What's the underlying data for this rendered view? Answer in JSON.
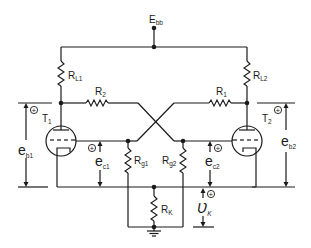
{
  "figure": {
    "type": "circuit-schematic"
  },
  "labels": {
    "supply": {
      "main": "E",
      "sub": "bb"
    },
    "rl1": {
      "main": "R",
      "sub": "L1"
    },
    "rl2": {
      "main": "R",
      "sub": "L2"
    },
    "r1": {
      "main": "R",
      "sub": "1"
    },
    "r2": {
      "main": "R",
      "sub": "2"
    },
    "rg1": {
      "main": "R",
      "sub": "g1"
    },
    "rg2": {
      "main": "R",
      "sub": "g2"
    },
    "rk": {
      "main": "R",
      "sub": "K"
    },
    "t1": {
      "main": "T",
      "sub": "1"
    },
    "t2": {
      "main": "T",
      "sub": "2"
    },
    "eb1": {
      "main": "e",
      "sub": "b1"
    },
    "eb2": {
      "main": "e",
      "sub": "b2"
    },
    "ec1": {
      "main": "e",
      "sub": "c1"
    },
    "ec2": {
      "main": "e",
      "sub": "c2"
    },
    "vk": {
      "main": "Ʋ",
      "sub": "K"
    },
    "plus": "+"
  }
}
